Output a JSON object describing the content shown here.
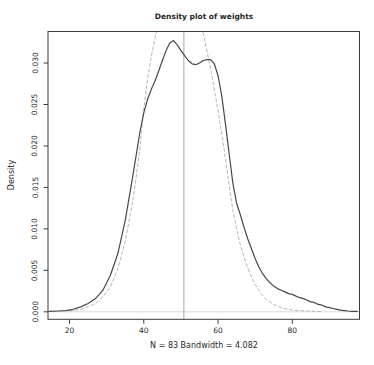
{
  "chart_data": {
    "type": "line",
    "title": "Density plot of weights",
    "xlabel": "N = 83   Bandwidth = 4.082",
    "ylabel": "Density",
    "x_ticks": [
      20,
      40,
      60,
      80
    ],
    "x_tick_labels": [
      "20",
      "40",
      "60",
      "80"
    ],
    "y_ticks": [
      0,
      0.005,
      0.01,
      0.015,
      0.02,
      0.025,
      0.03
    ],
    "y_tick_labels": [
      "0.000",
      "0.005",
      "0.010",
      "0.015",
      "0.020",
      "0.025",
      "0.030"
    ],
    "xlim": [
      14.2,
      98.1
    ],
    "ylim": [
      -0.0009,
      0.0338
    ],
    "grid": false,
    "legend": false,
    "vline_x": 50.8,
    "zero_line": true,
    "series": [
      {
        "name": "kernel density estimate",
        "line_style": "solid",
        "color": "#474747",
        "points": [
          [
            14.5,
            5e-05
          ],
          [
            17,
            0.0001
          ],
          [
            19,
            0.00015
          ],
          [
            21,
            0.0003
          ],
          [
            23,
            0.0006
          ],
          [
            25,
            0.001
          ],
          [
            27,
            0.0016
          ],
          [
            29,
            0.0026
          ],
          [
            31,
            0.0044
          ],
          [
            33,
            0.007
          ],
          [
            35,
            0.011
          ],
          [
            37,
            0.0163
          ],
          [
            39,
            0.0218
          ],
          [
            40,
            0.024
          ],
          [
            41,
            0.0256
          ],
          [
            42,
            0.0268
          ],
          [
            43,
            0.0278
          ],
          [
            44,
            0.029
          ],
          [
            45,
            0.0303
          ],
          [
            46,
            0.0315
          ],
          [
            47,
            0.0324
          ],
          [
            48,
            0.0327
          ],
          [
            49,
            0.0322
          ],
          [
            50,
            0.0315
          ],
          [
            51,
            0.0309
          ],
          [
            52,
            0.0303
          ],
          [
            53,
            0.0299
          ],
          [
            54,
            0.0298
          ],
          [
            55,
            0.03
          ],
          [
            56,
            0.0303
          ],
          [
            57,
            0.0304
          ],
          [
            58,
            0.0304
          ],
          [
            59,
            0.0299
          ],
          [
            60,
            0.0285
          ],
          [
            61,
            0.026
          ],
          [
            62,
            0.0226
          ],
          [
            63,
            0.019
          ],
          [
            64,
            0.0155
          ],
          [
            65,
            0.0131
          ],
          [
            66,
            0.0117
          ],
          [
            67,
            0.0102
          ],
          [
            68,
            0.0088
          ],
          [
            69,
            0.0076
          ],
          [
            70,
            0.0064
          ],
          [
            71,
            0.0054
          ],
          [
            72,
            0.0046
          ],
          [
            73,
            0.004
          ],
          [
            74,
            0.0035
          ],
          [
            75,
            0.0031
          ],
          [
            76,
            0.0028
          ],
          [
            77,
            0.0026
          ],
          [
            78,
            0.0024
          ],
          [
            79,
            0.0022
          ],
          [
            80,
            0.0021
          ],
          [
            81,
            0.0019
          ],
          [
            82,
            0.0017
          ],
          [
            83,
            0.0016
          ],
          [
            84,
            0.0014
          ],
          [
            85,
            0.0012
          ],
          [
            86,
            0.0011
          ],
          [
            87,
            0.0009
          ],
          [
            88,
            0.0008
          ],
          [
            89,
            0.0006
          ],
          [
            90,
            0.0005
          ],
          [
            91,
            0.0004
          ],
          [
            92,
            0.0003
          ],
          [
            93,
            0.0002
          ],
          [
            94,
            0.00015
          ],
          [
            95,
            0.0001
          ],
          [
            96,
            7e-05
          ],
          [
            97.5,
            5e-05
          ]
        ]
      },
      {
        "name": "normal reference density",
        "line_style": "dashed",
        "color": "#b5b5b5",
        "points": [
          [
            20,
            0.0001
          ],
          [
            23,
            0.0003
          ],
          [
            25,
            0.0006
          ],
          [
            27,
            0.001
          ],
          [
            29,
            0.0018
          ],
          [
            31,
            0.003
          ],
          [
            33,
            0.0052
          ],
          [
            35,
            0.0085
          ],
          [
            37,
            0.0133
          ],
          [
            38,
            0.0165
          ],
          [
            39,
            0.02
          ],
          [
            40,
            0.0245
          ],
          [
            41,
            0.028
          ],
          [
            42,
            0.0307
          ],
          [
            43,
            0.033
          ],
          [
            44,
            0.0348
          ],
          [
            46,
            0.0372
          ],
          [
            48,
            0.0386
          ],
          [
            50,
            0.0391
          ],
          [
            52,
            0.0386
          ],
          [
            54,
            0.037
          ],
          [
            55,
            0.0356
          ],
          [
            56,
            0.0336
          ],
          [
            57,
            0.0315
          ],
          [
            58,
            0.0293
          ],
          [
            59,
            0.0268
          ],
          [
            60,
            0.0243
          ],
          [
            61,
            0.0214
          ],
          [
            62,
            0.0185
          ],
          [
            63,
            0.0152
          ],
          [
            64,
            0.0122
          ],
          [
            65,
            0.01
          ],
          [
            66,
            0.0081
          ],
          [
            67,
            0.0066
          ],
          [
            68,
            0.0053
          ],
          [
            69,
            0.0042
          ],
          [
            70,
            0.0033
          ],
          [
            71,
            0.0026
          ],
          [
            72,
            0.002
          ],
          [
            73,
            0.0015
          ],
          [
            74,
            0.0012
          ],
          [
            75,
            0.0009
          ],
          [
            76,
            0.0007
          ],
          [
            77,
            0.0005
          ],
          [
            78,
            0.0004
          ],
          [
            79,
            0.0003
          ],
          [
            80,
            0.0002
          ],
          [
            82,
            0.00015
          ],
          [
            84,
            0.0001
          ],
          [
            86,
            7e-05
          ],
          [
            88,
            5e-05
          ]
        ]
      }
    ],
    "colors": {
      "box": "#3a3a3a",
      "vline": "#a8a8a8",
      "zero_line": "#d9d9d9",
      "text": "#1f1f1f"
    }
  }
}
